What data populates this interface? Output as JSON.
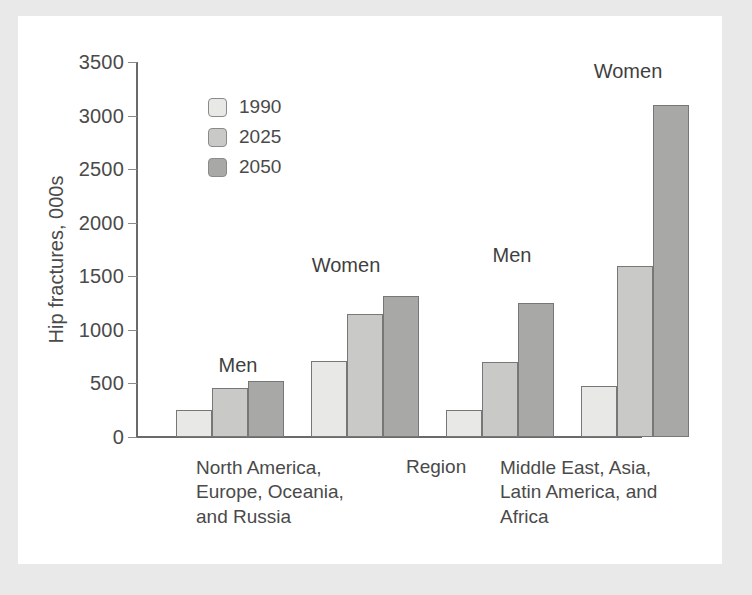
{
  "chart_data": {
    "type": "bar",
    "title": "",
    "xlabel": "Region",
    "ylabel": "Hip fractures, 000s",
    "ylim": [
      0,
      3500
    ],
    "ytick_values": [
      0,
      500,
      1000,
      1500,
      2000,
      2500,
      3000,
      3500
    ],
    "ytick_labels": [
      "0",
      "500",
      "1000",
      "1500",
      "2000",
      "2500",
      "3000",
      "3500"
    ],
    "grid": false,
    "legend_position": "upper-left-inside",
    "legend_entries": [
      "1990",
      "2025",
      "2050"
    ],
    "series": [
      {
        "name": "1990",
        "color": "#e8e8e6",
        "values": [
          250,
          710,
          250,
          480
        ]
      },
      {
        "name": "2025",
        "color": "#c9c9c7",
        "values": [
          460,
          1150,
          700,
          1600
        ]
      },
      {
        "name": "2050",
        "color": "#a8a8a6",
        "values": [
          525,
          1320,
          1250,
          3100
        ]
      }
    ],
    "categories": [
      "Men",
      "Women",
      "Men",
      "Women"
    ],
    "groups": [
      {
        "region": "North America,\nEurope, Oceania,\nand Russia",
        "sexes": [
          {
            "label": "Men",
            "values": {
              "1990": 250,
              "2025": 460,
              "2050": 525
            }
          },
          {
            "label": "Women",
            "values": {
              "1990": 710,
              "2025": 1150,
              "2050": 1320
            }
          }
        ]
      },
      {
        "region": "Middle East, Asia,\nLatin America, and\nAfrica",
        "sexes": [
          {
            "label": "Men",
            "values": {
              "1990": 250,
              "2025": 700,
              "2050": 1250
            }
          },
          {
            "label": "Women",
            "values": {
              "1990": 480,
              "2025": 1600,
              "2050": 3100
            }
          }
        ]
      }
    ]
  },
  "axis": {
    "y_title": "Hip fractures, 000s",
    "x_title": "Region",
    "ticks": [
      "3500",
      "3000",
      "2500",
      "2000",
      "1500",
      "1000",
      "500",
      "0"
    ]
  },
  "legend": {
    "items": [
      {
        "label": "1990",
        "color": "#e8e8e6"
      },
      {
        "label": "2025",
        "color": "#c9c9c7"
      },
      {
        "label": "2050",
        "color": "#a8a8a6"
      }
    ]
  },
  "group_labels": {
    "g1_men": "Men",
    "g1_women": "Women",
    "g2_men": "Men",
    "g2_women": "Women"
  },
  "category_labels": {
    "region1": "North America,\nEurope, Oceania,\nand Russia",
    "region2": "Middle East, Asia,\nLatin America, and\nAfrica"
  },
  "colors": {
    "frame": "#e9e9e9",
    "panel": "#ffffff",
    "axis": "#6a6a6a",
    "text": "#4a4a4a",
    "bar_1990": "#e8e8e6",
    "bar_2025": "#c9c9c7",
    "bar_2050": "#a8a8a6",
    "bar_edge": "#777777"
  }
}
